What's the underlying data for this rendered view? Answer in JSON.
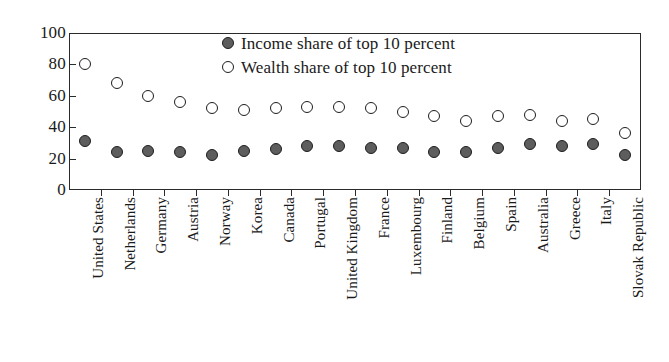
{
  "chart_data": {
    "type": "scatter",
    "title": "",
    "subtitle": "",
    "xlabel": "",
    "ylabel": "",
    "ylim": [
      0,
      100
    ],
    "yticks": [
      0,
      20,
      40,
      60,
      80,
      100
    ],
    "ytick_labels": [
      "0",
      "20",
      "40",
      "60",
      "80",
      "100"
    ],
    "grid": false,
    "legend_position": "top-center",
    "categories": [
      "United States",
      "Netherlands",
      "Germany",
      "Austria",
      "Norway",
      "Korea",
      "Canada",
      "Portugal",
      "United Kingdom",
      "France",
      "Luxembourg",
      "Finland",
      "Belgium",
      "Spain",
      "Australia",
      "Greece",
      "Italy",
      "Slovak Republic"
    ],
    "series": [
      {
        "name": "Income share of top 10 percent",
        "marker": "filled-circle",
        "color": "#5d5d5d",
        "edge_color": "#1d1d1d",
        "values": [
          31,
          24,
          25,
          24,
          22,
          25,
          26,
          28,
          28,
          27,
          27,
          24,
          24,
          27,
          29,
          28,
          29,
          22
        ]
      },
      {
        "name": "Wealth share of top 10 percent",
        "marker": "open-circle",
        "color": "#ffffff",
        "edge_color": "#1d1d1d",
        "values": [
          80,
          68,
          60,
          56,
          52,
          51,
          52,
          53,
          53,
          52,
          50,
          47,
          44,
          47,
          48,
          44,
          45,
          36
        ]
      }
    ]
  },
  "legend": {
    "items": [
      {
        "label": "Income share of top 10 percent",
        "marker": "filled-circle"
      },
      {
        "label": "Wealth share of top 10 percent",
        "marker": "open-circle"
      }
    ]
  },
  "colors": {
    "axis": "#2b2b2b",
    "text": "#1a1a1a",
    "income_fill": "#5d5d5d",
    "wealth_fill": "#ffffff",
    "marker_edge": "#1d1d1d",
    "background": "#ffffff"
  }
}
